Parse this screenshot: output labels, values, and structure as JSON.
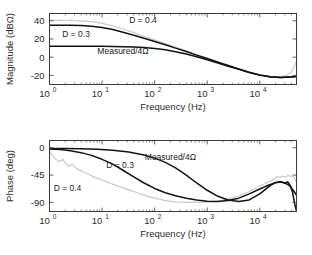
{
  "figure": {
    "title": "",
    "background": "#ffffff",
    "panels": [
      "magnitude",
      "phase"
    ]
  },
  "colors": {
    "curve_dark": "#121212",
    "curve_light": "#c9c9c9",
    "axis": "#3a3a3a",
    "text": "#2b2b2b"
  },
  "chart_data": [
    {
      "type": "line",
      "id": "magnitude-plot",
      "title": "",
      "xlabel": "Frequency (Hz)",
      "ylabel": "Magnitude (dBΩ)",
      "xscale": "log",
      "xlim": [
        1,
        50000
      ],
      "ylim": [
        -30,
        48
      ],
      "yticks": [
        40,
        20,
        0,
        -20
      ],
      "yticklabels": [
        "40",
        "20",
        "0",
        "-20"
      ],
      "xticks": [
        1,
        10,
        100,
        1000,
        10000
      ],
      "xticklabels": [
        "10^0",
        "10^1",
        "10^2",
        "10^3",
        "10^4"
      ],
      "grid": false,
      "legend_position": "inline-annotations",
      "annotations": [
        {
          "text": "D = 0.4",
          "x": 60,
          "y": 38
        },
        {
          "text": "D = 0.3",
          "x": 3.2,
          "y": 22
        },
        {
          "text": "Measured/4Ω",
          "x": 25,
          "y": 3
        }
      ],
      "series": [
        {
          "name": "D = 0.4",
          "color": "#121212",
          "x": [
            1,
            1.6,
            2.5,
            4,
            6.3,
            10,
            16,
            25,
            40,
            63,
            100,
            160,
            250,
            400,
            630,
            1000,
            1600,
            2500,
            4000,
            6300,
            10000,
            16000,
            25000,
            40000,
            50000
          ],
          "y": [
            35.2,
            35.1,
            35.0,
            34.7,
            34.0,
            32.6,
            30.4,
            27.5,
            24.2,
            20.8,
            17.3,
            13.7,
            10.0,
            6.2,
            2.3,
            -1.5,
            -5.4,
            -9.2,
            -13.0,
            -16.6,
            -19.6,
            -21.6,
            -22.2,
            -21.6,
            -21.2
          ]
        },
        {
          "name": "D = 0.3",
          "color": "#121212",
          "x": [
            1,
            1.6,
            2.5,
            4,
            6.3,
            10,
            16,
            25,
            40,
            63,
            100,
            160,
            250,
            400,
            630,
            1000,
            1600,
            2500,
            4000,
            6300,
            10000,
            16000,
            25000,
            40000,
            50000
          ],
          "y": [
            12.0,
            12.0,
            12.0,
            12.0,
            12.0,
            11.9,
            11.8,
            11.6,
            11.2,
            10.6,
            9.6,
            8.1,
            6.0,
            3.4,
            0.4,
            -2.8,
            -6.4,
            -9.9,
            -13.4,
            -16.8,
            -19.7,
            -21.7,
            -22.3,
            -21.7,
            -21.2
          ]
        },
        {
          "name": "Measured/4Ω",
          "color": "#c9c9c9",
          "x": [
            1,
            1.3,
            1.6,
            2,
            2.5,
            3.2,
            4,
            5,
            6.3,
            8,
            10,
            16,
            25,
            40,
            63,
            100,
            160,
            250,
            400,
            630,
            1000,
            1600,
            2500,
            4000,
            6300,
            10000,
            16000,
            25000,
            32000,
            40000,
            46000,
            50000
          ],
          "y": [
            41.0,
            40.4,
            40.8,
            40.0,
            40.9,
            40.2,
            39.8,
            39.4,
            39.0,
            38.2,
            37.2,
            34.5,
            31.0,
            27.0,
            23.0,
            19.0,
            15.0,
            11.0,
            7.0,
            3.0,
            -1.0,
            -5.0,
            -9.0,
            -13.0,
            -16.6,
            -19.6,
            -21.4,
            -21.4,
            -20.2,
            -16.5,
            -9.5,
            -4.0
          ]
        }
      ]
    },
    {
      "type": "line",
      "id": "phase-plot",
      "title": "",
      "xlabel": "Frequency (Hz)",
      "ylabel": "Phase (deg)",
      "xscale": "log",
      "xlim": [
        1,
        50000
      ],
      "ylim": [
        -105,
        12
      ],
      "yticks": [
        0,
        -45,
        -90
      ],
      "yticklabels": [
        "0",
        "-45",
        "-90"
      ],
      "xticks": [
        1,
        10,
        100,
        1000,
        10000
      ],
      "xticklabels": [
        "10^0",
        "10^1",
        "10^2",
        "10^3",
        "10^4"
      ],
      "grid": false,
      "legend_position": "inline-annotations",
      "annotations": [
        {
          "text": "Measured/4Ω",
          "x": 200,
          "y": -20
        },
        {
          "text": "D = 0.3",
          "x": 22,
          "y": -33
        },
        {
          "text": "D = 0.4",
          "x": 2.2,
          "y": -72
        }
      ],
      "series": [
        {
          "name": "Measured/4Ω (dark upper)",
          "color": "#121212",
          "x": [
            1,
            2,
            4,
            8,
            16,
            32,
            63,
            100,
            160,
            250,
            400,
            630,
            1000,
            1600,
            2500,
            4000,
            6300,
            10000,
            13000,
            16000,
            20000,
            25000,
            30000,
            34000,
            38000,
            42000,
            46000,
            50000
          ],
          "y": [
            -1.0,
            -1.2,
            -1.6,
            -2.4,
            -4.0,
            -7.0,
            -12.0,
            -17.0,
            -24.0,
            -33.0,
            -45.0,
            -58.0,
            -70.0,
            -80.0,
            -86.0,
            -88.5,
            -86.0,
            -76.0,
            -68.0,
            -62.0,
            -57.0,
            -56.0,
            -58.0,
            -56.5,
            -62.0,
            -73.0,
            -92.0,
            -104.0
          ]
        },
        {
          "name": "D = 0.3",
          "color": "#121212",
          "x": [
            1,
            1.6,
            2.5,
            4,
            6.3,
            10,
            16,
            25,
            40,
            63,
            100,
            160,
            250,
            400,
            630,
            1000,
            1600,
            2500,
            4000,
            6300,
            10000,
            13000,
            16000,
            20000,
            25000,
            30000,
            35000,
            40000,
            45000,
            50000
          ],
          "y": [
            -2.0,
            -3.0,
            -5.0,
            -8.0,
            -12.5,
            -19.0,
            -27.0,
            -37.0,
            -48.0,
            -58.0,
            -67.0,
            -74.0,
            -79.0,
            -83.0,
            -86.0,
            -88.0,
            -88.5,
            -87.0,
            -83.0,
            -76.0,
            -68.0,
            -63.5,
            -60.5,
            -57.5,
            -56.5,
            -58.0,
            -61.0,
            -66.0,
            -72.0,
            -78.0
          ]
        },
        {
          "name": "D = 0.4 (measured, light)",
          "color": "#c9c9c9",
          "x": [
            1,
            1.2,
            1.5,
            1.8,
            2.0,
            2.3,
            2.7,
            3.2,
            4,
            5,
            6.3,
            8,
            10,
            13,
            16,
            20,
            25,
            32,
            40,
            50,
            63,
            80,
            100,
            160,
            250,
            400,
            630,
            1000,
            1600,
            2500,
            4000,
            6300,
            10000,
            13000,
            16000,
            19000,
            21000,
            24000,
            27000,
            30000,
            34000,
            38000,
            42000,
            46000,
            50000
          ],
          "y": [
            -7.0,
            -15.0,
            -23.0,
            -19.0,
            -25.0,
            -31.0,
            -27.0,
            -34.0,
            -38.0,
            -42.0,
            -46.0,
            -50.0,
            -53.0,
            -57.0,
            -60.0,
            -63.0,
            -66.0,
            -69.0,
            -72.0,
            -75.0,
            -78.0,
            -81.0,
            -83.0,
            -87.0,
            -89.0,
            -90.0,
            -90.0,
            -89.5,
            -88.0,
            -84.5,
            -79.0,
            -72.0,
            -63.0,
            -58.5,
            -55.0,
            -52.0,
            -47.5,
            -49.0,
            -46.5,
            -48.5,
            -46.0,
            -46.5,
            -47.0,
            -50.0,
            -57.0
          ]
        }
      ]
    }
  ]
}
